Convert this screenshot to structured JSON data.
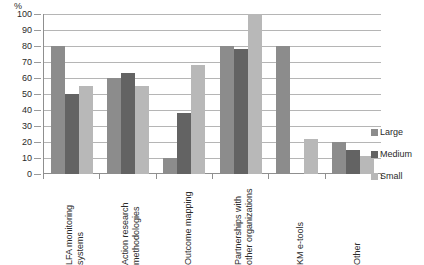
{
  "chart_data": {
    "type": "bar",
    "title": "",
    "xlabel": "",
    "ylabel": "%",
    "ylim": [
      0,
      100
    ],
    "ytick_step": 10,
    "yticks": [
      "100",
      "90",
      "80",
      "70",
      "60",
      "50",
      "40",
      "30",
      "20",
      "10",
      "0"
    ],
    "grid": true,
    "legend_position": "right",
    "categories": [
      "LFA monitoring systems",
      "Action research methodologies",
      "Outcome mapping",
      "Partnerships with other organizations",
      "KM e-tools",
      "Other"
    ],
    "category_lines": [
      [
        "LFA monitoring",
        "systems"
      ],
      [
        "Action research",
        "methodologies"
      ],
      [
        "Outcome mapping"
      ],
      [
        "Partnerships with",
        "other organizations"
      ],
      [
        "KM e-tools"
      ],
      [
        "Other"
      ]
    ],
    "series": [
      {
        "name": "Large",
        "color": "#8c8c8c",
        "values": [
          80,
          60,
          10,
          80,
          80,
          20
        ]
      },
      {
        "name": "Medium",
        "color": "#636363",
        "values": [
          50,
          63,
          38,
          78,
          0,
          15
        ]
      },
      {
        "name": "Small",
        "color": "#b8b8b8",
        "values": [
          55,
          55,
          68,
          100,
          22,
          11
        ]
      }
    ]
  },
  "axis": {
    "y_unit_label": "%"
  },
  "legend": {
    "entries": [
      {
        "label": "Large",
        "color": "#8c8c8c"
      },
      {
        "label": "Medium",
        "color": "#636363"
      },
      {
        "label": "Small",
        "color": "#b8b8b8"
      }
    ]
  }
}
